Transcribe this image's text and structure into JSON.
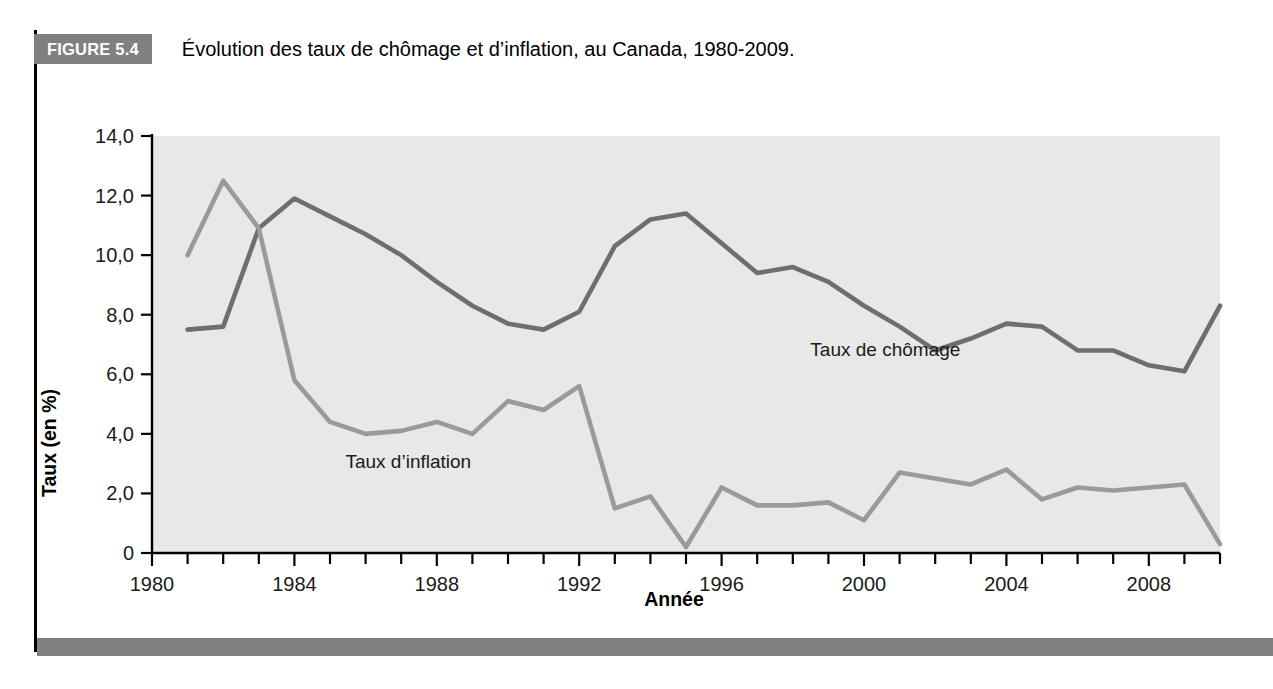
{
  "figure": {
    "badge": "FIGURE 5.4",
    "title": "Évolution des taux de chômage et d’inflation, au Canada, 1980-2009."
  },
  "colors": {
    "badge_background": "#808080",
    "bottom_bar": "#808080",
    "plot_background": "#e8e8e8",
    "unemployment_line": "#6e6e6e",
    "inflation_line": "#9a9a9a",
    "axis": "#000000"
  },
  "chart_data": {
    "type": "line",
    "title": "Évolution des taux de chômage et d’inflation, au Canada, 1980-2009.",
    "xlabel": "Année",
    "ylabel": "Taux (en %)",
    "xlim": [
      1980,
      2010
    ],
    "ylim": [
      0,
      14
    ],
    "grid": false,
    "legend_position": "inline-annotations",
    "x_tick_labels": [
      "1980",
      "1984",
      "1988",
      "1992",
      "1996",
      "2000",
      "2004",
      "2008"
    ],
    "x_tick_values": [
      1980,
      1984,
      1988,
      1992,
      1996,
      2000,
      2004,
      2008
    ],
    "x_minor_tick_values": [
      1981,
      1982,
      1983,
      1985,
      1986,
      1987,
      1989,
      1990,
      1991,
      1993,
      1994,
      1995,
      1997,
      1998,
      1999,
      2001,
      2002,
      2003,
      2005,
      2006,
      2007,
      2009,
      2010
    ],
    "y_tick_labels": [
      "0",
      "2,0",
      "4,0",
      "6,0",
      "8,0",
      "10,0",
      "12,0",
      "14,0"
    ],
    "y_tick_values": [
      0,
      2,
      4,
      6,
      8,
      10,
      12,
      14
    ],
    "x": [
      1981,
      1982,
      1983,
      1984,
      1985,
      1986,
      1987,
      1988,
      1989,
      1990,
      1991,
      1992,
      1993,
      1994,
      1995,
      1996,
      1997,
      1998,
      1999,
      2000,
      2001,
      2002,
      2003,
      2004,
      2005,
      2006,
      2007,
      2008,
      2009,
      2010
    ],
    "series": [
      {
        "name": "Taux de chômage",
        "color": "#6e6e6e",
        "label_x": 2000.6,
        "label_y": 6.6,
        "values": [
          7.5,
          7.6,
          10.9,
          11.9,
          11.3,
          10.7,
          10.0,
          9.1,
          8.3,
          7.7,
          7.5,
          8.1,
          10.3,
          11.2,
          11.4,
          10.4,
          9.4,
          9.6,
          9.1,
          8.3,
          7.6,
          6.8,
          7.2,
          7.7,
          7.6,
          6.8,
          6.8,
          6.3,
          6.1,
          8.3
        ]
      },
      {
        "name": "Taux d’inflation",
        "color": "#9a9a9a",
        "label_x": 1987.2,
        "label_y": 2.85,
        "values": [
          10.0,
          12.5,
          10.9,
          5.8,
          4.4,
          4.0,
          4.1,
          4.4,
          4.0,
          5.1,
          4.8,
          5.6,
          1.5,
          1.9,
          0.2,
          2.2,
          1.6,
          1.6,
          1.7,
          1.1,
          2.7,
          2.5,
          2.3,
          2.8,
          1.8,
          2.2,
          2.1,
          2.2,
          2.3,
          0.3
        ]
      }
    ]
  }
}
